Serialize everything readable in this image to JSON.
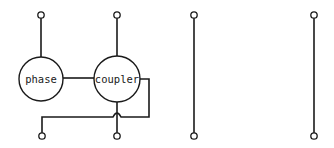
{
  "diagram": {
    "type": "circuit-schematic",
    "colors": {
      "stroke": "#1a1a1a",
      "background": "#ffffff"
    },
    "nodes": [
      {
        "id": "phase",
        "label": "phase",
        "cx": 41,
        "cy": 79,
        "r": 22
      },
      {
        "id": "coupler",
        "label": "coupler",
        "cx": 117,
        "cy": 79,
        "r": 23
      }
    ],
    "terminals": {
      "top": [
        {
          "id": "t1-top",
          "x": 41,
          "y": 15
        },
        {
          "id": "t2-top",
          "x": 117,
          "y": 15
        },
        {
          "id": "t3-top",
          "x": 194,
          "y": 15
        },
        {
          "id": "t4-top",
          "x": 314,
          "y": 15
        }
      ],
      "bottom": [
        {
          "id": "t1-bottom",
          "x": 42,
          "y": 136
        },
        {
          "id": "t2-bottom",
          "x": 117,
          "y": 136
        },
        {
          "id": "t3-bottom",
          "x": 194,
          "y": 136
        },
        {
          "id": "t4-bottom",
          "x": 314,
          "y": 136
        }
      ]
    },
    "connections": [
      "t1-top to phase",
      "t2-top to coupler",
      "phase to coupler",
      "coupler to t2-bottom",
      "coupler right tap crosses over to t1-bottom",
      "t3-top to t3-bottom",
      "t4-top to t4-bottom"
    ]
  }
}
